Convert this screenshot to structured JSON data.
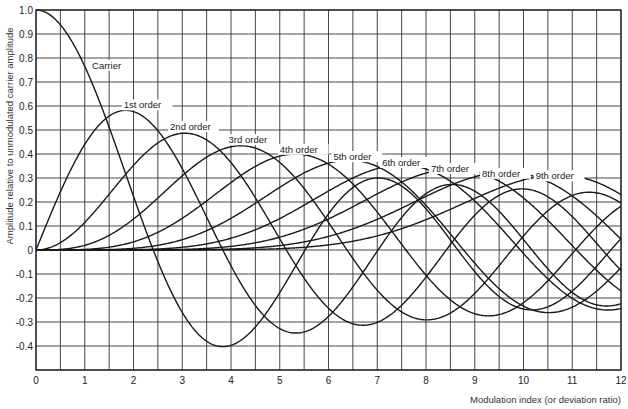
{
  "chart_data": {
    "type": "line",
    "title": "",
    "xlabel": "Modulation index (or deviation ratio)",
    "ylabel": "Amplitude relative to unmodulated carrier amplitude",
    "xlim": [
      0,
      12
    ],
    "ylim": [
      -0.5,
      1.0
    ],
    "grid": true,
    "x_ticks": [
      "0",
      "1",
      "2",
      "3",
      "4",
      "5",
      "6",
      "7",
      "8",
      "9",
      "10",
      "11",
      "12"
    ],
    "y_ticks": [
      "1.0",
      "0.9",
      "0.8",
      "0.7",
      "0.6",
      "0.5",
      "0.4",
      "0.3",
      "0.2",
      "0.1",
      "0",
      "-0.1",
      "-0.2",
      "-0.3",
      "-0.4"
    ],
    "x": [
      0,
      1,
      2,
      3,
      4,
      5,
      6,
      7,
      8,
      9,
      10,
      11,
      12
    ],
    "series": [
      {
        "name": "Carrier",
        "order": 0,
        "values": [
          1.0,
          0.765,
          0.224,
          -0.26,
          -0.397,
          -0.178,
          0.151,
          0.3,
          0.172,
          -0.09,
          -0.246,
          -0.171,
          0.048
        ]
      },
      {
        "name": "1st order",
        "order": 1,
        "values": [
          0,
          0.44,
          0.577,
          0.339,
          -0.066,
          -0.328,
          -0.277,
          -0.005,
          0.235,
          0.245,
          0.043,
          -0.177,
          -0.223
        ]
      },
      {
        "name": "2nd order",
        "order": 2,
        "values": [
          0,
          0.115,
          0.353,
          0.486,
          0.364,
          0.047,
          -0.243,
          -0.301,
          -0.113,
          0.145,
          0.255,
          0.139,
          -0.085
        ]
      },
      {
        "name": "3rd order",
        "order": 3,
        "values": [
          0,
          0.02,
          0.129,
          0.309,
          0.43,
          0.365,
          0.115,
          -0.168,
          -0.291,
          -0.181,
          0.058,
          0.227,
          0.195
        ]
      },
      {
        "name": "4th order",
        "order": 4,
        "values": [
          0,
          0.002,
          0.034,
          0.132,
          0.281,
          0.391,
          0.358,
          0.158,
          -0.105,
          -0.265,
          -0.22,
          -0.015,
          0.182
        ]
      },
      {
        "name": "5th order",
        "order": 5,
        "values": [
          0,
          0.0,
          0.007,
          0.043,
          0.132,
          0.261,
          0.362,
          0.348,
          0.186,
          -0.055,
          -0.234,
          -0.238,
          -0.073
        ]
      },
      {
        "name": "6th order",
        "order": 6,
        "values": [
          0,
          0.0,
          0.001,
          0.011,
          0.049,
          0.131,
          0.246,
          0.339,
          0.338,
          0.204,
          -0.014,
          -0.202,
          -0.244
        ]
      },
      {
        "name": "7th order",
        "order": 7,
        "values": [
          0,
          0.0,
          0.0,
          0.003,
          0.015,
          0.053,
          0.13,
          0.234,
          0.321,
          0.327,
          0.217,
          0.018,
          -0.17
        ]
      },
      {
        "name": "8th order",
        "order": 8,
        "values": [
          0,
          0.0,
          0.0,
          0.001,
          0.004,
          0.018,
          0.057,
          0.128,
          0.224,
          0.305,
          0.318,
          0.225,
          0.045
        ]
      },
      {
        "name": "9th order",
        "order": 9,
        "values": [
          0,
          0.0,
          0.0,
          0.0,
          0.001,
          0.006,
          0.021,
          0.059,
          0.126,
          0.215,
          0.292,
          0.31,
          0.23
        ]
      }
    ],
    "annotations": [
      {
        "text": "Carrier",
        "x": 1.15,
        "y": 0.755
      },
      {
        "text": "1st order",
        "x": 1.8,
        "y": 0.59
      },
      {
        "text": "2nd order",
        "x": 2.75,
        "y": 0.5
      },
      {
        "text": "3rd order",
        "x": 3.95,
        "y": 0.445
      },
      {
        "text": "4th order",
        "x": 5.0,
        "y": 0.405
      },
      {
        "text": "5th order",
        "x": 6.1,
        "y": 0.375
      },
      {
        "text": "6th order",
        "x": 7.1,
        "y": 0.35
      },
      {
        "text": "7th order",
        "x": 8.1,
        "y": 0.325
      },
      {
        "text": "8th order",
        "x": 9.15,
        "y": 0.305
      },
      {
        "text": "9th order",
        "x": 10.25,
        "y": 0.295
      }
    ],
    "legend_position": "none (inline curve labels)"
  }
}
